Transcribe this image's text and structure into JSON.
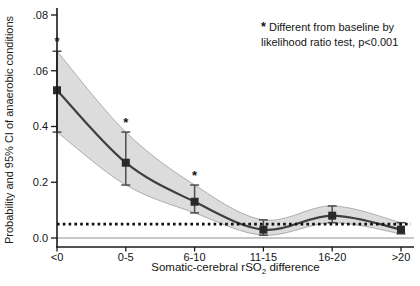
{
  "chart_data": {
    "type": "line",
    "title": "",
    "ylabel": "Probability and 95% CI of anaerobic conditions",
    "xlabel_prefix": "Somatic-cerebral rSO",
    "xlabel_sub": "2",
    "xlabel_suffix": " difference",
    "categories": [
      "<0",
      "0-5",
      "6-10",
      "11-15",
      "16-20",
      ">20"
    ],
    "values": [
      0.053,
      0.027,
      0.013,
      0.003,
      0.008,
      0.003
    ],
    "ci_lower": [
      0.038,
      0.019,
      0.009,
      0.001,
      0.0055,
      0.0015
    ],
    "ci_upper": [
      0.067,
      0.038,
      0.019,
      0.0065,
      0.0115,
      0.0055
    ],
    "significant": [
      true,
      true,
      true,
      false,
      false,
      false
    ],
    "baseline": 0.005,
    "ylim": [
      0,
      0.08
    ],
    "ytick_labels": [
      ".08",
      ".06",
      "0.4",
      "0.2",
      "0.0"
    ],
    "ytick_values": [
      0.08,
      0.06,
      0.04,
      0.02,
      0
    ],
    "grid": "off",
    "legend": "none",
    "annotation": {
      "star": "*",
      "line1": "Different from baseline by",
      "line2": "likelihood ratio test, p<0.001"
    },
    "colors": {
      "band": "#dcdcdc",
      "band_edge": "#9c9c9c",
      "line": "#3f3f3f",
      "marker": "#2a2a2a",
      "error": "#4d4d4d",
      "baseline": "#0f0f0f",
      "axis": "#1a1a1a",
      "zero_line": "#b5b5b5"
    }
  }
}
